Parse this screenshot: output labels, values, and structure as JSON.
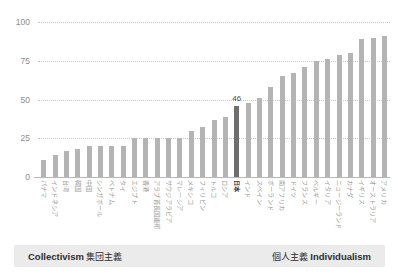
{
  "chart_data": {
    "type": "bar",
    "title": "",
    "subtitle": "",
    "xlabel": "",
    "ylabel": "",
    "ylim": [
      0,
      100
    ],
    "yticks": [
      "0",
      "25",
      "50",
      "75",
      "100"
    ],
    "ytick_values": [
      0,
      25,
      50,
      75,
      100
    ],
    "grid": "horizontal-dotted",
    "legend_position": "bottom",
    "bar_color": "#b4b4b4",
    "highlight_color": "#6e6e6e",
    "highlight_category": "日本",
    "categories": [
      "パナマ",
      "インドネシア",
      "台湾",
      "韓国",
      "中国",
      "シンガポール",
      "ベトナム",
      "タイ",
      "エジプト",
      "香港",
      "アラブ首長国連邦",
      "サウジアラビア",
      "マレーシア",
      "メキシコ",
      "フィリピン",
      "トルコ",
      "ロシア",
      "日本",
      "インド",
      "スペイン",
      "ポーランド",
      "南アフリカ",
      "ドイツ",
      "フランス",
      "ベルギー",
      "イタリア",
      "ニュージーランド",
      "カナダ",
      "イギリス",
      "オーストラリア",
      "アメリカ"
    ],
    "values": [
      11,
      14,
      17,
      18,
      20,
      20,
      20,
      20,
      25,
      25,
      25,
      25,
      25,
      30,
      32,
      37,
      39,
      46,
      48,
      51,
      58,
      65,
      67,
      71,
      75,
      76,
      79,
      80,
      89,
      90,
      91
    ],
    "value_labels": {
      "日本": "46"
    },
    "annotations": [
      {
        "category": "日本",
        "text": "46"
      }
    ]
  },
  "legend": {
    "left_en": "Collectivism",
    "left_jp": "集団主義",
    "right_jp": "個人主義",
    "right_en": "Individualism"
  }
}
